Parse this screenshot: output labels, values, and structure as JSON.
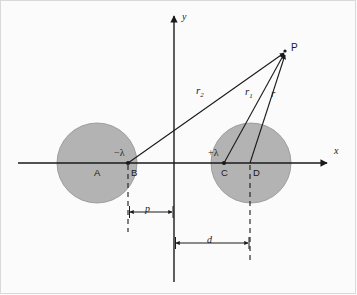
{
  "figure": {
    "type": "physics-diagram",
    "background_color": "#fbfbfb",
    "shading_color": "#b3b3b3",
    "stroke_color": "#1a1a1a"
  },
  "axes": {
    "x_label": "x",
    "y_label": "y",
    "origin_x": 174,
    "origin_y": 163
  },
  "cylinders": [
    {
      "name": "left-cylinder",
      "center_label": "A",
      "center_x": 97,
      "center_y": 163,
      "radius": 40,
      "charge_label": "−λ",
      "line_charge_point_label": "B",
      "line_charge_x": 128,
      "line_charge_y": 163
    },
    {
      "name": "right-cylinder",
      "center_label": "D",
      "center_x": 251,
      "center_y": 163,
      "radius": 40,
      "charge_label": "+λ",
      "line_charge_point_label": "C",
      "line_charge_x": 224,
      "line_charge_y": 163
    }
  ],
  "field_point": {
    "label": "P",
    "x": 285,
    "y": 52
  },
  "vectors": [
    {
      "name": "r2",
      "label": "r",
      "subscript": "2",
      "from_label": "B",
      "to_label": "P",
      "label_x": 196,
      "label_y": 92
    },
    {
      "name": "r1",
      "label": "r",
      "subscript": "1",
      "from_label": "C",
      "to_label": "P",
      "label_x": 245,
      "label_y": 93
    },
    {
      "name": "r",
      "label": "r",
      "subscript": "",
      "from_label": "D",
      "to_label": "P",
      "label_x": 271,
      "label_y": 93
    }
  ],
  "dimensions": [
    {
      "name": "p-dimension",
      "label": "p",
      "from_x": 128,
      "to_x": 174,
      "y": 212,
      "label_x": 146,
      "label_y": 205
    },
    {
      "name": "d-dimension",
      "label": "d",
      "from_x": 174,
      "to_x": 250,
      "y": 243,
      "label_x": 208,
      "label_y": 236
    }
  ],
  "guide_lines": [
    {
      "name": "b-guide",
      "x": 128,
      "from_y": 163,
      "to_y": 230
    },
    {
      "name": "d-guide",
      "x": 250,
      "from_y": 163,
      "to_y": 258
    }
  ]
}
